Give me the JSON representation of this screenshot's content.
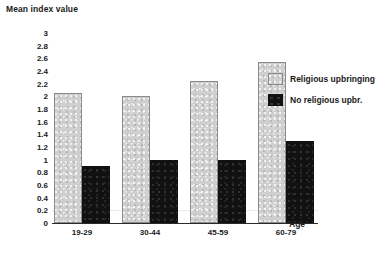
{
  "chart_data": {
    "type": "bar",
    "title": "",
    "subtitle": "",
    "ylabel": "Mean index value",
    "xlabel": "Age",
    "categories": [
      "19-29",
      "30-44",
      "45-59",
      "60-79"
    ],
    "series": [
      {
        "name": "Religious upbringing",
        "values": [
          2.05,
          2.0,
          2.25,
          2.55
        ],
        "color": "#cfcfcf"
      },
      {
        "name": "No religious upbr.",
        "values": [
          0.9,
          1.0,
          1.0,
          1.3
        ],
        "color": "#111111"
      }
    ],
    "ylim": [
      0,
      3
    ],
    "ytick_labels": [
      "3",
      "2.8",
      "2.6",
      "2.4",
      "2.2",
      "2",
      "1.8",
      "1.6",
      "1.4",
      "1.2",
      "1",
      "0.8",
      "0.6",
      "0.4",
      "0.2",
      "0"
    ],
    "ytick_values": [
      3,
      2.8,
      2.6,
      2.4,
      2.2,
      2,
      1.8,
      1.6,
      1.4,
      1.2,
      1,
      0.8,
      0.6,
      0.4,
      0.2,
      0
    ],
    "ytick_step": 0.2,
    "grid": false,
    "legend_position": "upper-right",
    "legend": [
      "Religious upbringing",
      "No religious upbr."
    ]
  }
}
